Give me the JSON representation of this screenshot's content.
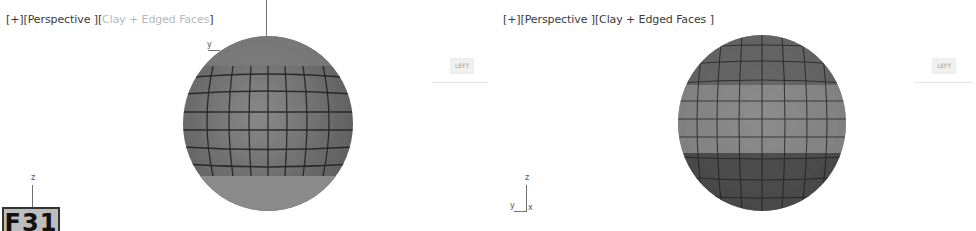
{
  "viewports": [
    {
      "id": "left",
      "label_parts": [
        {
          "text": "[+]",
          "dim": false
        },
        {
          "text": "[Perspective ]",
          "dim": false
        },
        {
          "text": "[",
          "dim": false
        },
        {
          "text": "Clay + Edged Faces",
          "dim": true
        },
        {
          "text": "]",
          "dim": false
        }
      ],
      "viewcube_face": "LEFT",
      "gizmo": {
        "z_label": "z",
        "y_label": "y"
      }
    },
    {
      "id": "right",
      "label_parts": [
        {
          "text": "[+]",
          "dim": false
        },
        {
          "text": "[Perspective ]",
          "dim": false
        },
        {
          "text": "[Clay + Edged Faces ]",
          "dim": false
        }
      ],
      "viewcube_face": "LEFT",
      "gizmo": {
        "z_label": "z",
        "y_label": "y",
        "x_label": "x"
      }
    }
  ],
  "figure_badge": "F31",
  "colors": {
    "sphere_base": "#7a7a7a",
    "sphere_band": "#8e8e8e",
    "grid_line": "#1e1e1e",
    "label_text": "#3a3a3a",
    "label_dim": "#b8b8b8"
  }
}
